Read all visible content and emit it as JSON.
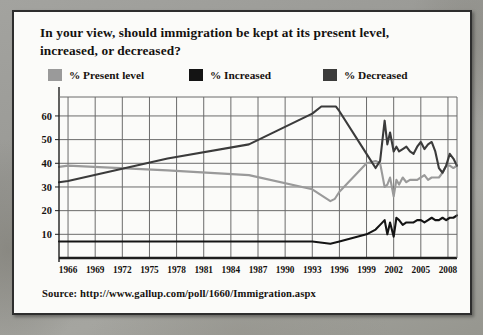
{
  "card": {
    "title": "In your view, should immigration be kept at its present level, increased, or decreased?",
    "source": "Source: http://www.gallup.com/poll/1660/Immigration.aspx"
  },
  "colors": {
    "present_level": "#9a9a9a",
    "increased": "#141414",
    "decreased": "#3b3b3b",
    "grid": "#6b6b6b",
    "axis": "#1e1e1e",
    "card_bg": "#fbfbf9",
    "page_bg": "#9c9c99"
  },
  "legend": {
    "items": [
      {
        "label": "% Present level",
        "color": "#9a9a9a",
        "icon": "legend-swatch-present-level"
      },
      {
        "label": "% Increased",
        "color": "#141414",
        "icon": "legend-swatch-increased"
      },
      {
        "label": "% Decreased",
        "color": "#3b3b3b",
        "icon": "legend-swatch-decreased"
      }
    ]
  },
  "chart_data": {
    "type": "line",
    "title": "In your view, should immigration be kept at its present level, increased, or decreased?",
    "xlabel": "",
    "ylabel": "",
    "xlim": [
      1965,
      2009
    ],
    "ylim": [
      0,
      68
    ],
    "grid": true,
    "legend_position": "top",
    "ytick_labels": [
      "10",
      "20",
      "30",
      "40",
      "50",
      "60"
    ],
    "yticks": [
      10,
      20,
      30,
      40,
      50,
      60
    ],
    "xtick_labels": [
      "1966",
      "1969",
      "1972",
      "1975",
      "1978",
      "1981",
      "1984",
      "1987",
      "1990",
      "1993",
      "1996",
      "1999",
      "2002",
      "2005",
      "2008"
    ],
    "xticks": [
      1966,
      1969,
      1972,
      1975,
      1978,
      1981,
      1984,
      1987,
      1990,
      1993,
      1996,
      1999,
      2002,
      2005,
      2008
    ],
    "series": [
      {
        "name": "% Present level",
        "color": "#9a9a9a",
        "x": [
          1965,
          1966,
          1977,
          1986,
          1993,
          1995,
          1995.5,
          1996,
          1999,
          2000,
          2000.5,
          2001,
          2001.3,
          2001.6,
          2002,
          2002.3,
          2002.6,
          2003,
          2003.4,
          2003.8,
          2004.2,
          2004.6,
          2005,
          2005.4,
          2005.8,
          2006.2,
          2006.6,
          2007,
          2007.4,
          2007.8,
          2008.2,
          2008.6,
          2009
        ],
        "values": [
          38.5,
          39,
          37,
          35,
          29,
          24,
          25,
          28,
          40,
          41,
          40,
          30,
          31,
          34,
          26,
          33,
          31,
          34,
          32,
          33,
          33,
          33,
          34,
          35,
          33,
          34,
          34,
          34,
          36,
          39,
          39,
          38,
          39
        ]
      },
      {
        "name": "% Increased",
        "color": "#141414",
        "x": [
          1965,
          1966,
          1977,
          1986,
          1993,
          1995,
          1996,
          1999,
          2000,
          2000.5,
          2001,
          2001.3,
          2001.6,
          2002,
          2002.3,
          2002.6,
          2003,
          2003.4,
          2003.8,
          2004.2,
          2004.6,
          2005,
          2005.4,
          2005.8,
          2006.2,
          2006.6,
          2007,
          2007.4,
          2007.8,
          2008.2,
          2008.6,
          2009
        ],
        "values": [
          7,
          7,
          7,
          7,
          7,
          6,
          7,
          10,
          12,
          14,
          16,
          10,
          15,
          9,
          17,
          16,
          14,
          15,
          15,
          15,
          16,
          16,
          15,
          16,
          17,
          16,
          16,
          17,
          16,
          17,
          17,
          18
        ]
      },
      {
        "name": "% Decreased",
        "color": "#3b3b3b",
        "x": [
          1965,
          1966,
          1977,
          1986,
          1993,
          1994,
          1995,
          1995.6,
          1996,
          1999,
          2000,
          2000.5,
          2001,
          2001.3,
          2001.6,
          2002,
          2002.3,
          2002.6,
          2003,
          2003.4,
          2003.8,
          2004.2,
          2004.6,
          2005,
          2005.4,
          2005.8,
          2006.2,
          2006.6,
          2007,
          2007.4,
          2007.8,
          2008.2,
          2008.6,
          2009
        ],
        "values": [
          32,
          32.5,
          42,
          48,
          61,
          64,
          64,
          64,
          62,
          44,
          38,
          41,
          58,
          48,
          53,
          45,
          47,
          45,
          46,
          47,
          45,
          44,
          47,
          49,
          46,
          48,
          49,
          45,
          38,
          36,
          39,
          44,
          42,
          39
        ]
      }
    ]
  },
  "axes": {
    "ytick_values": [
      10,
      20,
      30,
      40,
      50,
      60
    ]
  }
}
